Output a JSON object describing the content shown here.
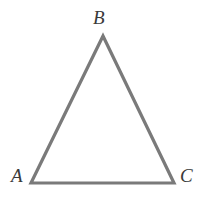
{
  "figure": {
    "type": "geometry-diagram",
    "shape": "triangle",
    "background_color": "#ffffff",
    "canvas": {
      "width": 205,
      "height": 199
    },
    "stroke": {
      "color": "#7a7a7a",
      "width": 3.2,
      "linejoin": "miter",
      "linecap": "butt"
    },
    "label_style": {
      "color": "#3a3a3a",
      "font_size": 19,
      "italic": true,
      "serif": true
    },
    "vertices": [
      {
        "name": "A",
        "label": "A",
        "x": 31,
        "y": 183,
        "label_x": 11,
        "label_y": 166
      },
      {
        "name": "B",
        "label": "B",
        "x": 103,
        "y": 36,
        "label_x": 93,
        "label_y": 8
      },
      {
        "name": "C",
        "label": "C",
        "x": 174,
        "y": 183,
        "label_x": 180,
        "label_y": 166
      }
    ],
    "edges": [
      {
        "name": "AB",
        "from": "A",
        "to": "B"
      },
      {
        "name": "BC",
        "from": "B",
        "to": "C"
      },
      {
        "name": "CA",
        "from": "C",
        "to": "A"
      }
    ],
    "path": "M 31 183 L 103 36 L 174 183 Z"
  }
}
